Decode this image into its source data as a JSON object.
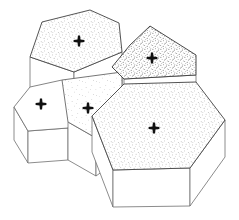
{
  "figure": {
    "title": "Columnar polygonal prism cluster",
    "background_color": "#ffffff",
    "line_color": "#6f6f6f",
    "line_color_dark": "#4a4a4a",
    "marker_color": "#111111",
    "marker_glyph": "cross",
    "marker_count": 5,
    "canvas": {
      "width": 239,
      "height": 220
    }
  },
  "palette": {
    "fill_white": "#ffffff",
    "fill_stipple_light": "#f2f2f2",
    "fill_stipple_medium": "#e4e4e4",
    "fill_stipple_dark": "#d7d7d7",
    "stipple_dot": "#7a7a7a",
    "stipple_dot_dark": "#5e5e5e",
    "side_face": "#ffffff",
    "outline": "#6f6f6f"
  },
  "prisms": [
    {
      "id": "prism-top-left",
      "label": "Top-left hexagonal prism",
      "top_face": {
        "name": "hexagon-top-left",
        "shape": "hexagon",
        "fill": "stipple_medium",
        "points": "30,57 42,22 90,10 119,23 122,52 74,72",
        "marker": {
          "x": 79,
          "y": 41
        }
      },
      "side_faces": [
        {
          "name": "side-left",
          "points": "30,57 74,72 74,106 30,93",
          "fill": "white"
        },
        {
          "name": "side-front",
          "points": "74,72 122,52 122,88 74,106",
          "fill": "white"
        }
      ]
    },
    {
      "id": "prism-left",
      "label": "Left pentagonal prism",
      "top_face": {
        "name": "pentagon-left",
        "shape": "pentagon",
        "fill": "white",
        "points": "14,107 30,87 62,80 82,103 68,128 28,131",
        "marker": {
          "x": 41,
          "y": 104
        }
      },
      "side_faces": [
        {
          "name": "side-left",
          "points": "14,107 28,131 28,163 14,140",
          "fill": "white"
        },
        {
          "name": "side-front",
          "points": "28,131 68,128 68,160 28,163",
          "fill": "white"
        }
      ]
    },
    {
      "id": "prism-middle",
      "label": "Middle faint quadrilateral prism",
      "top_face": {
        "name": "quad-middle",
        "shape": "quadrilateral",
        "fill": "stipple_light",
        "points": "62,80 122,72 122,88 132,118 96,138 68,122",
        "marker": {
          "x": 88,
          "y": 108
        }
      },
      "side_faces": [
        {
          "name": "side-front",
          "points": "68,122 96,138 96,176 68,160",
          "fill": "white"
        },
        {
          "name": "side-right",
          "points": "96,138 132,118 132,150 96,176",
          "fill": "white"
        }
      ]
    },
    {
      "id": "prism-top-right",
      "label": "Top-right pentagonal prism",
      "top_face": {
        "name": "pentagon-top-right",
        "shape": "pentagon",
        "fill": "stipple_dark",
        "points": "112,67 130,45 150,26 196,55 196,75 124,79",
        "marker": {
          "x": 152,
          "y": 58
        }
      },
      "side_faces": [
        {
          "name": "side-front",
          "points": "124,79 196,75 196,84 124,88",
          "fill": "white"
        }
      ]
    },
    {
      "id": "prism-main",
      "label": "Large foreground hexagonal prism",
      "top_face": {
        "name": "hexagon-main",
        "shape": "hexagon",
        "fill": "stipple_medium",
        "points": "92,116 124,84 196,82 225,120 190,168 113,170",
        "marker": {
          "x": 154,
          "y": 128
        }
      },
      "side_faces": [
        {
          "name": "side-left",
          "points": "92,116 113,170 113,207 92,152",
          "fill": "white"
        },
        {
          "name": "side-front",
          "points": "113,170 190,168 190,206 113,207",
          "fill": "white"
        },
        {
          "name": "side-right",
          "points": "190,168 225,120 225,157 190,206",
          "fill": "white"
        }
      ]
    }
  ]
}
